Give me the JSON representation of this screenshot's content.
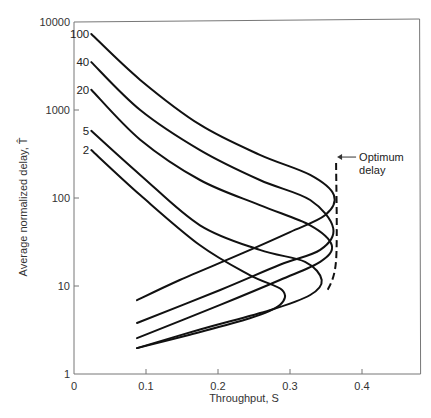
{
  "chart_data": {
    "type": "line",
    "title": "",
    "xlabel": "Throughput, S",
    "ylabel": "Average normalized delay, T̂",
    "xlim": [
      0,
      0.48
    ],
    "ylim": [
      1,
      10000
    ],
    "yscale": "log",
    "grid": false,
    "x_ticks": [
      {
        "value": 0,
        "label": "0"
      },
      {
        "value": 0.1,
        "label": "0.1"
      },
      {
        "value": 0.2,
        "label": "0.2"
      },
      {
        "value": 0.3,
        "label": "0.3"
      },
      {
        "value": 0.4,
        "label": "0.4"
      }
    ],
    "y_ticks": [
      {
        "value": 1,
        "label": "1"
      },
      {
        "value": 10,
        "label": "10"
      },
      {
        "value": 100,
        "label": "100"
      },
      {
        "value": 1000,
        "label": "1000"
      },
      {
        "value": 10000,
        "label": "10000"
      }
    ],
    "series": [
      {
        "name": "100",
        "label": "100",
        "points": [
          [
            0.024,
            7300
          ],
          [
            0.092,
            2200
          ],
          [
            0.175,
            680
          ],
          [
            0.258,
            310
          ],
          [
            0.328,
            183
          ],
          [
            0.361,
            108
          ],
          [
            0.349,
            64
          ],
          [
            0.3,
            41
          ],
          [
            0.231,
            23
          ],
          [
            0.147,
            11.7
          ],
          [
            0.0875,
            6.9
          ]
        ]
      },
      {
        "name": "40",
        "label": "40",
        "points": [
          [
            0.024,
            3500
          ],
          [
            0.092,
            1000
          ],
          [
            0.175,
            350
          ],
          [
            0.258,
            160
          ],
          [
            0.328,
            95
          ],
          [
            0.36,
            45.5
          ],
          [
            0.342,
            25.7
          ],
          [
            0.286,
            17.4
          ],
          [
            0.203,
            9
          ],
          [
            0.0875,
            3.8
          ]
        ]
      },
      {
        "name": "20",
        "label": "20",
        "points": [
          [
            0.024,
            1700
          ],
          [
            0.092,
            460
          ],
          [
            0.175,
            160
          ],
          [
            0.258,
            83
          ],
          [
            0.328,
            49
          ],
          [
            0.358,
            29
          ],
          [
            0.342,
            18.8
          ],
          [
            0.286,
            11.7
          ],
          [
            0.203,
            6.1
          ],
          [
            0.0875,
            2.56
          ]
        ]
      },
      {
        "name": "5",
        "label": "5",
        "points": [
          [
            0.024,
            580
          ],
          [
            0.092,
            183
          ],
          [
            0.175,
            49
          ],
          [
            0.258,
            25.7
          ],
          [
            0.321,
            18.8
          ],
          [
            0.344,
            11.7
          ],
          [
            0.328,
            7.9
          ],
          [
            0.272,
            5.3
          ],
          [
            0.175,
            3.2
          ],
          [
            0.0875,
            1.97
          ]
        ]
      },
      {
        "name": "2",
        "label": "2",
        "points": [
          [
            0.024,
            350
          ],
          [
            0.092,
            108
          ],
          [
            0.175,
            29
          ],
          [
            0.244,
            13.3
          ],
          [
            0.289,
            9
          ],
          [
            0.286,
            6.1
          ],
          [
            0.244,
            4.3
          ],
          [
            0.161,
            2.8
          ],
          [
            0.0875,
            1.97
          ]
        ]
      }
    ],
    "annotations": [
      {
        "name": "optimum-delay",
        "text_lines": [
          "Optimum",
          "delay"
        ],
        "style": "dashed",
        "points": [
          [
            0.364,
            250
          ],
          [
            0.364,
            19.7
          ],
          [
            0.351,
            8.5
          ]
        ],
        "arrow_target": [
          0.364,
          108
        ]
      }
    ],
    "legend": "inline-labels-at-curve-start"
  }
}
